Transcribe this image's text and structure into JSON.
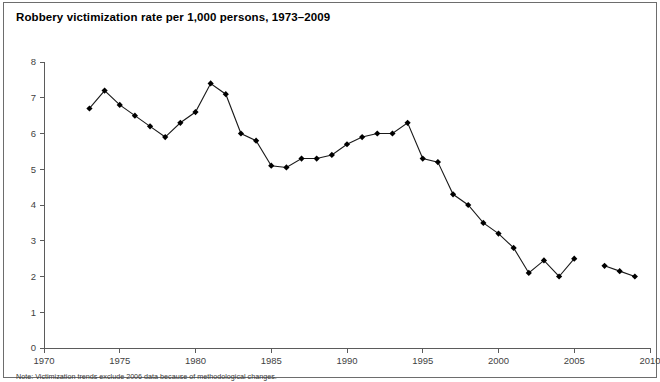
{
  "figure": {
    "title": "Robbery victimization rate per 1,000 persons, 1973–2009",
    "note": "Note: Victimization trends exclude 2006 data because of methodological changes."
  },
  "chart_data": {
    "type": "line",
    "title": "Robbery victimization rate per 1,000 persons, 1973–2009",
    "xlabel": "",
    "ylabel": "",
    "xlim": [
      1970,
      2010
    ],
    "ylim": [
      0,
      8
    ],
    "xticks": [
      1970,
      1975,
      1980,
      1985,
      1990,
      1995,
      2000,
      2005,
      2010
    ],
    "yticks": [
      0,
      1,
      2,
      3,
      4,
      5,
      6,
      7,
      8
    ],
    "grid": false,
    "legend": null,
    "marker": "diamond",
    "line_color": "#1a1a1a",
    "marker_color": "#000000",
    "x": [
      1973,
      1974,
      1975,
      1976,
      1977,
      1978,
      1979,
      1980,
      1981,
      1982,
      1983,
      1984,
      1985,
      1986,
      1987,
      1988,
      1989,
      1990,
      1991,
      1992,
      1993,
      1994,
      1995,
      1996,
      1997,
      1998,
      1999,
      2000,
      2001,
      2002,
      2003,
      2004,
      2005,
      2007,
      2008,
      2009
    ],
    "values": [
      6.7,
      7.2,
      6.8,
      6.5,
      6.2,
      5.9,
      6.3,
      6.6,
      7.4,
      7.1,
      6.0,
      5.8,
      5.1,
      5.05,
      5.3,
      5.3,
      5.4,
      5.7,
      5.9,
      6.0,
      6.0,
      6.3,
      5.3,
      5.2,
      4.3,
      4.0,
      3.5,
      3.2,
      2.8,
      2.1,
      2.45,
      2.0,
      2.5,
      2.3,
      2.15,
      2.0
    ],
    "break_after_year": 2005,
    "excluded_years": [
      2006
    ]
  }
}
